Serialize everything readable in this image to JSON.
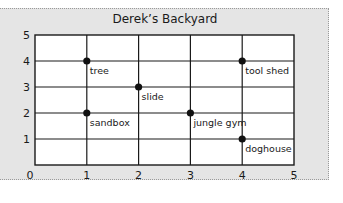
{
  "chart_data": {
    "type": "scatter",
    "title": "Derek’s Backyard",
    "xlabel": "",
    "ylabel": "",
    "xlim": [
      0,
      5
    ],
    "ylim": [
      0,
      5
    ],
    "grid": true,
    "x_ticks": [
      "0",
      "1",
      "2",
      "3",
      "4",
      "5"
    ],
    "y_ticks": [
      "1",
      "2",
      "3",
      "4",
      "5"
    ],
    "points": [
      {
        "label": "tree",
        "x": 1,
        "y": 4
      },
      {
        "label": "tool shed",
        "x": 4,
        "y": 4
      },
      {
        "label": "slide",
        "x": 2,
        "y": 3
      },
      {
        "label": "sandbox",
        "x": 1,
        "y": 2
      },
      {
        "label": "jungle gym",
        "x": 3,
        "y": 2
      },
      {
        "label": "doghouse",
        "x": 4,
        "y": 1
      }
    ]
  },
  "colors": {
    "panel_background": "#e5e5e5",
    "plot_background": "#ffffff",
    "grid_line": "#1a1a1a",
    "point": "#111111"
  }
}
